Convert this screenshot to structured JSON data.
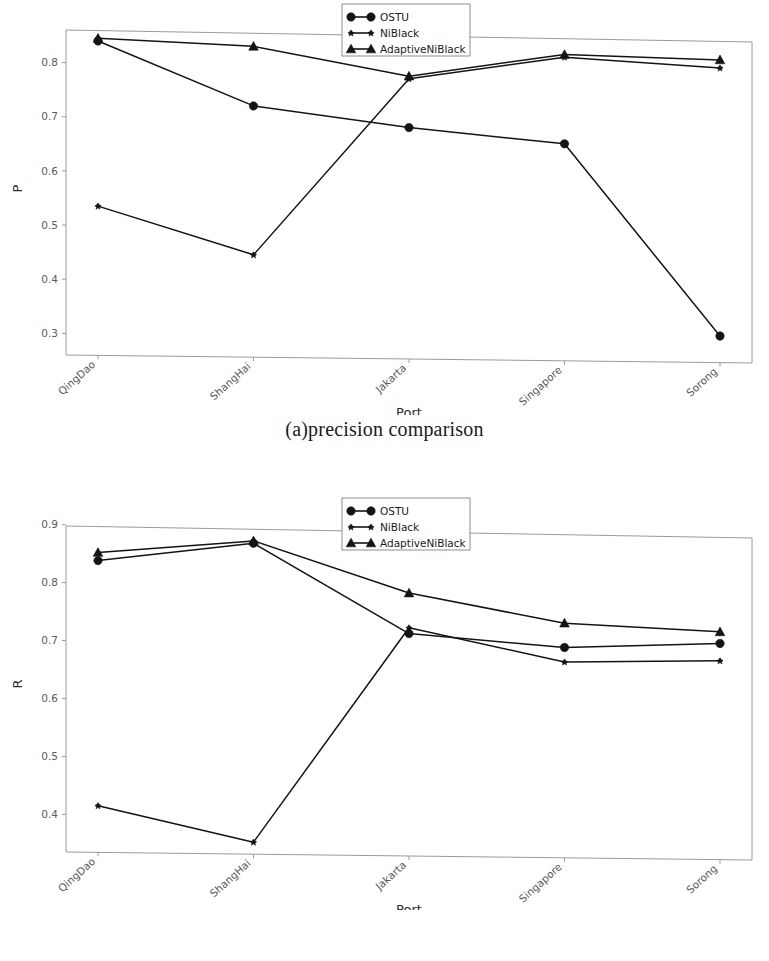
{
  "figure": {
    "panels": [
      {
        "id": "a",
        "caption": "(a)precision comparison",
        "ylabel": "P",
        "xlabel": "Port"
      },
      {
        "id": "b",
        "caption": "(b) recall comparison",
        "ylabel": "R",
        "xlabel": "Port"
      }
    ]
  },
  "legend": {
    "entries": [
      {
        "label": "OSTU",
        "marker": "circle-marker"
      },
      {
        "label": "NiBlack",
        "marker": "star-marker"
      },
      {
        "label": "AdaptiveNiBlack",
        "marker": "triangle-marker"
      }
    ]
  },
  "colors": {
    "line": "#141414",
    "spine": "#9a9a9a",
    "tick_text": "#5a5a5a",
    "caption": "#1a1a1a",
    "background": "#ffffff"
  },
  "chart_data": [
    {
      "type": "line",
      "title": "(a)precision comparison",
      "xlabel": "Port",
      "ylabel": "P",
      "categories": [
        "QingDao",
        "ShangHai",
        "Jakarta",
        "Singapore",
        "Sorong"
      ],
      "ytick_labels": [
        "0.3",
        "0.4",
        "0.5",
        "0.6",
        "0.7",
        "0.8"
      ],
      "yticks": [
        0.3,
        0.4,
        0.5,
        0.6,
        0.7,
        0.8
      ],
      "ylim": [
        0.26,
        0.875
      ],
      "grid": false,
      "legend_position": "top-center",
      "series": [
        {
          "name": "OSTU",
          "marker": "circle",
          "values": [
            0.84,
            0.72,
            0.68,
            0.65,
            0.295
          ]
        },
        {
          "name": "NiBlack",
          "marker": "star",
          "values": [
            0.535,
            0.445,
            0.77,
            0.81,
            0.79
          ]
        },
        {
          "name": "AdaptiveNiBlack",
          "marker": "triangle",
          "values": [
            0.845,
            0.83,
            0.775,
            0.815,
            0.805
          ]
        }
      ]
    },
    {
      "type": "line",
      "title": "(b) recall comparison",
      "xlabel": "Port",
      "ylabel": "R",
      "categories": [
        "QingDao",
        "ShangHai",
        "Jakarta",
        "Singapore",
        "Sorong"
      ],
      "ytick_labels": [
        "0.4",
        "0.5",
        "0.6",
        "0.7",
        "0.8",
        "0.9"
      ],
      "yticks": [
        0.4,
        0.5,
        0.6,
        0.7,
        0.8,
        0.9
      ],
      "ylim": [
        0.335,
        0.915
      ],
      "grid": false,
      "legend_position": "top-center",
      "series": [
        {
          "name": "OSTU",
          "marker": "circle",
          "values": [
            0.838,
            0.868,
            0.712,
            0.688,
            0.695
          ]
        },
        {
          "name": "NiBlack",
          "marker": "star",
          "values": [
            0.415,
            0.352,
            0.722,
            0.663,
            0.665
          ]
        },
        {
          "name": "AdaptiveNiBlack",
          "marker": "triangle",
          "values": [
            0.852,
            0.872,
            0.782,
            0.73,
            0.715
          ]
        }
      ]
    }
  ]
}
